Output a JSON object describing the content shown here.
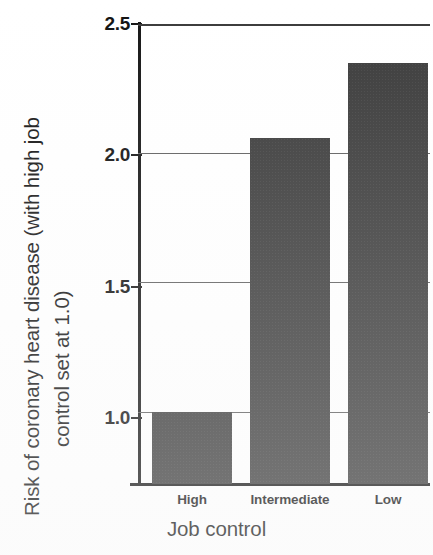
{
  "chart_data": {
    "type": "bar",
    "title": "",
    "subtitle": "",
    "xlabel": "Job control",
    "ylabel": "Risk of coronary heart disease (with high job control set at 1.0)",
    "ylabel_line1": "Risk of coronary heart disease (with high job",
    "ylabel_line2": "control set at 1.0)",
    "categories": [
      "High",
      "Intermediate",
      "Low"
    ],
    "values": [
      1.0,
      2.06,
      2.35
    ],
    "ylim": [
      0.72,
      2.5
    ],
    "yticks": [
      1.0,
      1.5,
      2.0,
      2.5
    ],
    "ytick_labels": [
      "1.0",
      "1.5",
      "2.0",
      "2.5"
    ],
    "grid": true,
    "grid_axis": "y",
    "legend": false,
    "legend_position": "none",
    "bar_color": "#3b3b3b",
    "axis_color": "#161616",
    "grid_color": "#5f5f5f",
    "background": "#ffffff"
  },
  "axes": {
    "y_title_line1": "Risk of coronary heart disease (with high job",
    "y_title_line2": "control set at 1.0)",
    "x_title": "Job control",
    "y_ticks": [
      {
        "label": "2.5",
        "value": 2.5
      },
      {
        "label": "2.0",
        "value": 2.0
      },
      {
        "label": "1.5",
        "value": 1.5
      },
      {
        "label": "1.0",
        "value": 1.0
      }
    ],
    "x_ticks": [
      {
        "label": "High"
      },
      {
        "label": "Intermediate"
      },
      {
        "label": "Low"
      }
    ]
  },
  "bars": [
    {
      "category": "High",
      "value": 1.0
    },
    {
      "category": "Intermediate",
      "value": 2.06
    },
    {
      "category": "Low",
      "value": 2.35
    }
  ]
}
